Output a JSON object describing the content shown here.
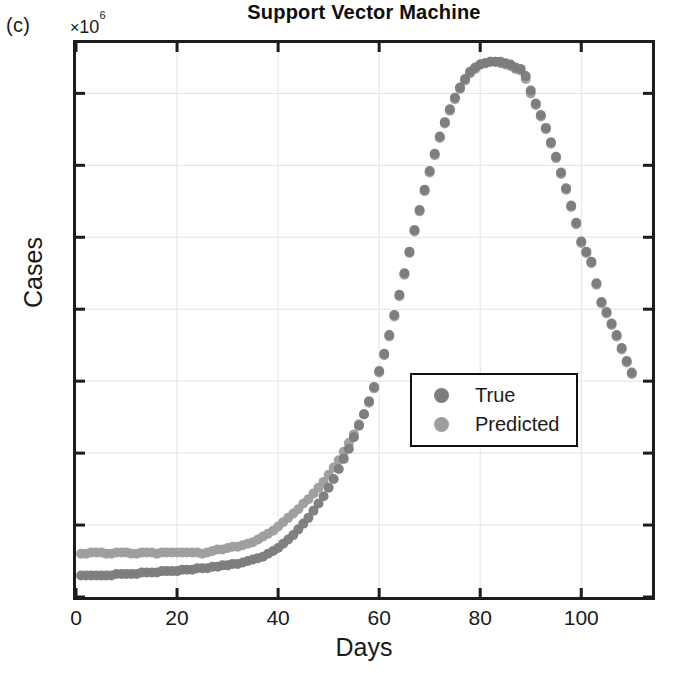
{
  "panel": {
    "label": "(c)"
  },
  "axes": {
    "y_exponent_mult": "×",
    "y_exponent_base": "10",
    "y_exponent_power": "6",
    "y_title": "Cases",
    "x_title": "Days"
  },
  "legend": {
    "position": "center-right",
    "items": [
      {
        "label": "True",
        "color": "#7d7d7d"
      },
      {
        "label": "Predicted",
        "color": "#9e9e9e"
      }
    ]
  },
  "colors": {
    "true_series": "#7d7d7d",
    "predicted_series": "#9e9e9e",
    "axis": "#1c1c1c",
    "grid": "#e2e2e2",
    "text": "#1a1a1a"
  },
  "chart_data": {
    "type": "scatter",
    "title": "Support Vector Machine",
    "xlabel": "Days",
    "ylabel": "Cases",
    "y_exponent": 1000000,
    "y_exponent_label": "×10⁶",
    "xlim": [
      0,
      114
    ],
    "ylim": [
      0,
      3.85
    ],
    "xticks": [
      0,
      20,
      40,
      60,
      80,
      100
    ],
    "xtick_labels": [
      "0",
      "20",
      "40",
      "60",
      "80",
      "100"
    ],
    "yticks": [
      0,
      0.5,
      1,
      1.5,
      2,
      2.5,
      3,
      3.5
    ],
    "ytick_labels": [
      "0",
      "0.5",
      "1",
      "1.5",
      "2",
      "2.5",
      "3",
      "3.5"
    ],
    "grid": true,
    "legend_position": "center-right",
    "marker": "circle",
    "marker_size": 9,
    "x": [
      1,
      2,
      3,
      4,
      5,
      6,
      7,
      8,
      9,
      10,
      11,
      12,
      13,
      14,
      15,
      16,
      17,
      18,
      19,
      20,
      21,
      22,
      23,
      24,
      25,
      26,
      27,
      28,
      29,
      30,
      31,
      32,
      33,
      34,
      35,
      36,
      37,
      38,
      39,
      40,
      41,
      42,
      43,
      44,
      45,
      46,
      47,
      48,
      49,
      50,
      51,
      52,
      53,
      54,
      55,
      56,
      57,
      58,
      59,
      60,
      61,
      62,
      63,
      64,
      65,
      66,
      67,
      68,
      69,
      70,
      71,
      72,
      73,
      74,
      75,
      76,
      77,
      78,
      79,
      80,
      81,
      82,
      83,
      84,
      85,
      86,
      87,
      88,
      89,
      90,
      91,
      92,
      93,
      94,
      95,
      96,
      97,
      98,
      99,
      100,
      101,
      102,
      103,
      104,
      105,
      106,
      107,
      108,
      109,
      110
    ],
    "series": [
      {
        "name": "True",
        "color": "#7d7d7d",
        "values": [
          0.15,
          0.15,
          0.15,
          0.15,
          0.15,
          0.15,
          0.15,
          0.16,
          0.16,
          0.16,
          0.16,
          0.16,
          0.17,
          0.17,
          0.17,
          0.17,
          0.18,
          0.18,
          0.18,
          0.18,
          0.19,
          0.19,
          0.19,
          0.2,
          0.2,
          0.2,
          0.21,
          0.21,
          0.22,
          0.22,
          0.23,
          0.23,
          0.24,
          0.25,
          0.26,
          0.27,
          0.28,
          0.3,
          0.32,
          0.34,
          0.37,
          0.4,
          0.43,
          0.47,
          0.51,
          0.55,
          0.6,
          0.65,
          0.7,
          0.76,
          0.82,
          0.89,
          0.96,
          1.03,
          1.11,
          1.19,
          1.27,
          1.36,
          1.46,
          1.57,
          1.69,
          1.82,
          1.96,
          2.1,
          2.25,
          2.4,
          2.55,
          2.69,
          2.83,
          2.96,
          3.08,
          3.2,
          3.3,
          3.39,
          3.47,
          3.54,
          3.6,
          3.65,
          3.68,
          3.7,
          3.71,
          3.72,
          3.72,
          3.72,
          3.71,
          3.7,
          3.68,
          3.67,
          3.62,
          3.52,
          3.43,
          3.35,
          3.26,
          3.16,
          3.06,
          2.95,
          2.84,
          2.72,
          2.6,
          2.47,
          2.4,
          2.33,
          2.18,
          2.05,
          1.98,
          1.9,
          1.82,
          1.73,
          1.64,
          1.56
        ]
      },
      {
        "name": "Predicted",
        "color": "#9e9e9e",
        "values": [
          0.3,
          0.3,
          0.31,
          0.31,
          0.31,
          0.3,
          0.3,
          0.31,
          0.31,
          0.31,
          0.3,
          0.3,
          0.31,
          0.31,
          0.31,
          0.3,
          0.31,
          0.31,
          0.31,
          0.31,
          0.31,
          0.31,
          0.31,
          0.31,
          0.3,
          0.31,
          0.32,
          0.33,
          0.33,
          0.34,
          0.35,
          0.35,
          0.36,
          0.37,
          0.38,
          0.4,
          0.42,
          0.44,
          0.46,
          0.49,
          0.52,
          0.55,
          0.58,
          0.61,
          0.65,
          0.68,
          0.72,
          0.76,
          0.8,
          0.85,
          0.9,
          0.95,
          1.01,
          1.07,
          1.13,
          1.2,
          1.27,
          1.35,
          1.45,
          1.56,
          1.68,
          1.81,
          1.95,
          2.09,
          2.24,
          2.39,
          2.54,
          2.68,
          2.82,
          2.95,
          3.07,
          3.19,
          3.29,
          3.38,
          3.46,
          3.53,
          3.59,
          3.64,
          3.67,
          3.7,
          3.71,
          3.72,
          3.72,
          3.71,
          3.7,
          3.69,
          3.67,
          3.66,
          3.6,
          3.5,
          3.42,
          3.34,
          3.25,
          3.15,
          3.05,
          2.94,
          2.83,
          2.71,
          2.59,
          2.46,
          2.39,
          2.32,
          2.17,
          2.04,
          1.97,
          1.89,
          1.81,
          1.72,
          1.63,
          1.55
        ]
      }
    ]
  }
}
